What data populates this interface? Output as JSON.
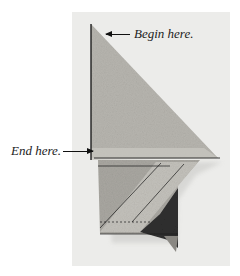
{
  "image": {
    "description": "Photograph of a folded fabric/paper quilt piece on a light board with instructional labels",
    "background_color": "#ffffff",
    "board_color": "#ececea"
  },
  "labels": {
    "begin": "Begin here.",
    "end": "End here."
  },
  "colors": {
    "fabric_light": "#b9b7b1",
    "fabric_mid": "#a8a6a0",
    "fabric_dark": "#2e2e2e",
    "stitch_line": "#1a1a1a"
  }
}
